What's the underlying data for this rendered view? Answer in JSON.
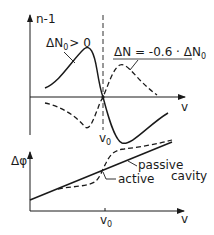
{
  "figure": {
    "top_panel": {
      "y_axis_label": "n-1",
      "x_axis_label": "v",
      "center_label": "v",
      "center_label_sub": "0",
      "curve_solid_label": "ΔN",
      "curve_solid_label_sub": "0",
      "curve_solid_label_suffix": "> 0",
      "curve_dashed_label_prefix": "ΔN = -0.6 · ΔN",
      "curve_dashed_label_sub": "0"
    },
    "bottom_panel": {
      "y_axis_label": "Δφ",
      "x_axis_label": "v",
      "tick_label": "v",
      "tick_label_sub": "0",
      "passive_label": "passive",
      "cavity_label": "cavity",
      "active_label": "active"
    },
    "colors": {
      "ink": "#1a1a1a",
      "background": "#ffffff"
    }
  }
}
